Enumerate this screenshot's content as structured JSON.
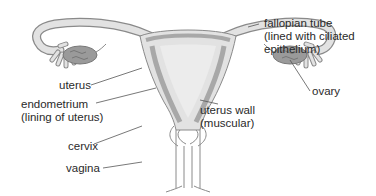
{
  "diagram": {
    "colors": {
      "tissue_fill": "#e2e2e2",
      "wall_band": "#a8a8a8",
      "outline": "#8a8a8a",
      "ovary_fill": "#9a9a9a",
      "leader_line": "#555555",
      "text": "#2a2a2a"
    },
    "labels": {
      "fallopian_tube": {
        "line1": "fallopian tube",
        "line2": "(lined with ciliated",
        "line3": "epithelium)"
      },
      "uterus": {
        "line1": "uterus"
      },
      "ovary": {
        "line1": "ovary"
      },
      "endometrium": {
        "line1": "endometrium",
        "line2": "(lining of uterus)"
      },
      "uterus_wall": {
        "line1": "uterus wall",
        "line2": "(muscular)"
      },
      "cervix": {
        "line1": "cervix"
      },
      "vagina": {
        "line1": "vagina"
      }
    }
  }
}
